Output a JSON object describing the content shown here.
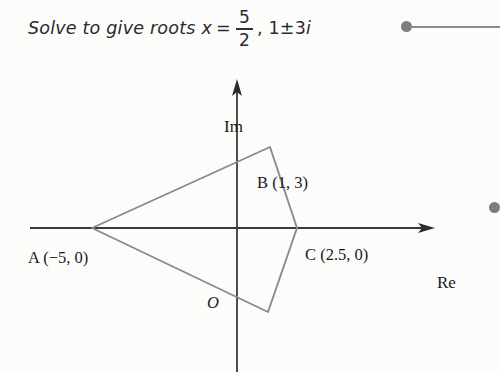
{
  "solution": {
    "prefix": "Solve to give roots",
    "variable": "x",
    "equals": "=",
    "fraction_numerator": "5",
    "fraction_denominator": "2",
    "remaining_roots": ", 1±3",
    "imaginary_unit": "i"
  },
  "diagram": {
    "axis_im_label": "Im",
    "axis_re_label": "Re",
    "origin_label": "O",
    "line_color": "#8a8a8a",
    "axis_color": "#3a3a3a",
    "points": [
      {
        "name": "A",
        "coords": "(−5, 0)",
        "label": "A (−5, 0)",
        "x": -5,
        "y": 0
      },
      {
        "name": "B",
        "coords": "(1, 3)",
        "label": "B (1, 3)",
        "x": 1,
        "y": 3
      },
      {
        "name": "C",
        "coords": "(2.5, 0)",
        "label": "C (2.5, 0)",
        "x": 2.5,
        "y": 0
      },
      {
        "name": "D",
        "coords": "(1, −3)",
        "label": "D (1, −3)",
        "x": 1,
        "y": -3
      }
    ]
  },
  "markers": {
    "top_bullet": "bullet-marker",
    "right_bullet": "bullet-marker",
    "connector": "horizontal-rule"
  }
}
